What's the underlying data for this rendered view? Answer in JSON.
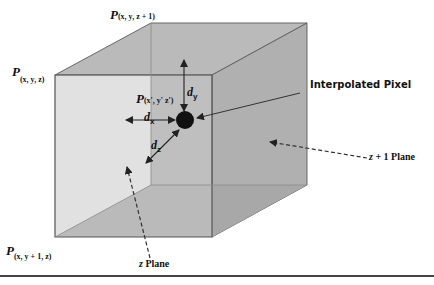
{
  "figure": {
    "colors": {
      "top_face": "#b9b9b9",
      "back_face": "#b3b3b3",
      "front_face": "#c6c6c6",
      "bottom_face": "#a9a9a9",
      "edge": "#555555",
      "pixel": "#111111",
      "rule": "#444444"
    },
    "corner_labels": {
      "top_back": {
        "main": "P",
        "sub": "(x, y, z + 1)"
      },
      "top_front": {
        "main": "P",
        "sub": "(x, y, z)"
      },
      "bottom_front": {
        "main": "P",
        "sub": "(x, y + 1, z)"
      }
    },
    "point_label": {
      "main": "P",
      "sub": "(x', y' z')"
    },
    "distances": {
      "dy": {
        "main": "d",
        "sub": "y"
      },
      "dx": {
        "main": "d",
        "sub": "x"
      },
      "dz": {
        "main": "d",
        "sub": "z"
      }
    },
    "callouts": {
      "interpolated_pixel": "Interpolated Pixel",
      "z1_plane_var": "z",
      "z1_plane_rest": " + 1 Plane",
      "z_plane_var": "z",
      "z_plane_rest": " Plane"
    }
  }
}
